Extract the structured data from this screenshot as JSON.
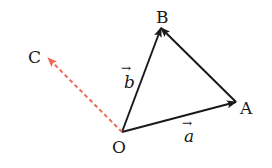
{
  "diagram": {
    "type": "vector-diagram",
    "points": {
      "O": {
        "label": "O",
        "x": 122,
        "y": 132
      },
      "A": {
        "label": "A",
        "x": 236,
        "y": 102
      },
      "B": {
        "label": "B",
        "x": 161,
        "y": 28
      },
      "C": {
        "label": "C",
        "x": 48,
        "y": 58
      }
    },
    "vectors": [
      {
        "from": "O",
        "to": "A",
        "label": "a",
        "style": "solid",
        "color": "#1a1a1a"
      },
      {
        "from": "O",
        "to": "B",
        "label": "b",
        "style": "solid",
        "color": "#1a1a1a"
      },
      {
        "from": "A",
        "to": "B",
        "label": "",
        "style": "solid",
        "color": "#1a1a1a"
      },
      {
        "from": "O",
        "to": "C",
        "label": "",
        "style": "dashed",
        "color": "#ef6a5a"
      }
    ],
    "vector_labels": {
      "a": "a",
      "b": "b",
      "arrow": "→"
    }
  }
}
